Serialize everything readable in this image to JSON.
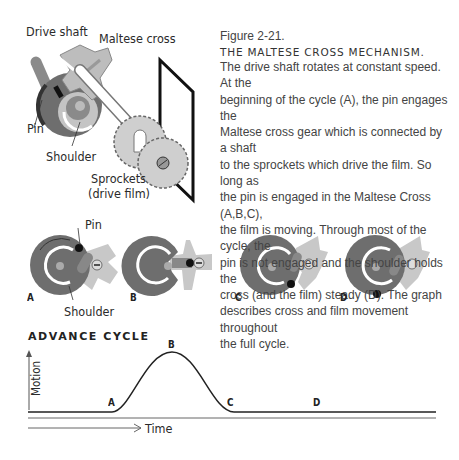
{
  "figure": {
    "number": "Figure 2-21.",
    "title": "THE MALTESE CROSS MECHANISM.",
    "caption_lines": [
      "The drive shaft rotates at constant speed. At the",
      "beginning of the cycle (A), the pin engages the",
      "Maltese cross gear which is connected by a shaft",
      "to the sprockets which drive the film. So long as",
      "the pin is engaged in the Maltese Cross (A,B,C),",
      "the film is moving. Through most of the cycle, the",
      "pin is not engaged and the shoulder holds the",
      "cross (and the film) steady (D). The graph",
      "describes cross and film movement throughout",
      "the full cycle."
    ]
  },
  "mechanism_labels": {
    "drive_shaft": "Drive shaft",
    "maltese_cross": "Maltese cross",
    "pin": "Pin",
    "shoulder": "Shoulder",
    "sprockets_line1": "Sprockets",
    "sprockets_line2": "(drive film)"
  },
  "stages": {
    "pin_label": "Pin",
    "shoulder_label": "Shoulder",
    "items": [
      {
        "letter": "A"
      },
      {
        "letter": "B"
      },
      {
        "letter": "C"
      },
      {
        "letter": "D"
      }
    ]
  },
  "graph": {
    "title": "ADVANCE CYCLE",
    "y_label": "Motion",
    "x_label": "Time",
    "points": {
      "A": "A",
      "B": "B",
      "C": "C",
      "D": "D"
    }
  },
  "colors": {
    "dark_gray": "#6e6e6e",
    "light_gray": "#c8c8c8",
    "mid_gray": "#999999",
    "ink": "#222222"
  }
}
